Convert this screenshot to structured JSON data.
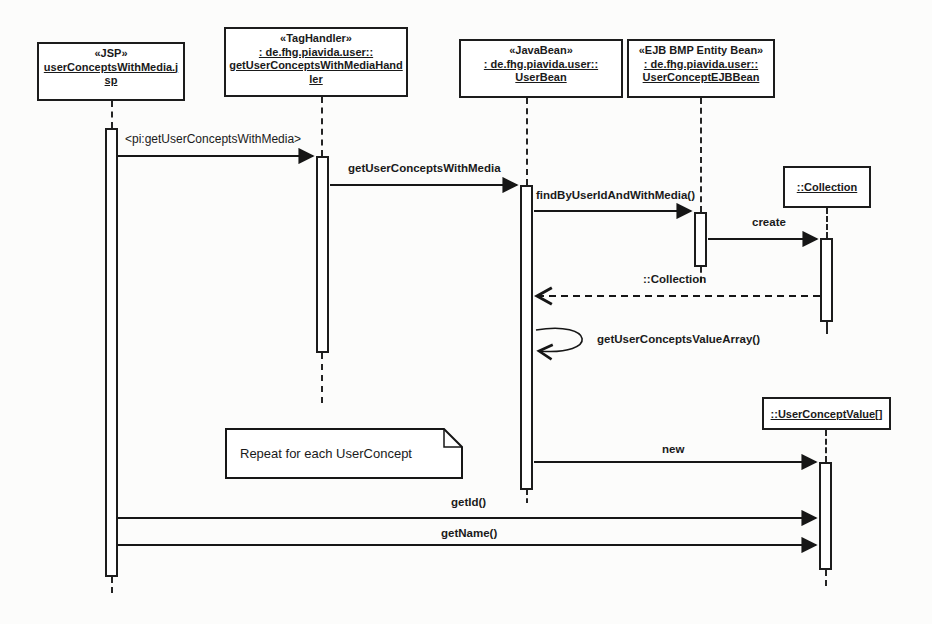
{
  "colors": {
    "ink": "#1c1c1c",
    "paper": "#fcfcfb"
  },
  "participants": [
    {
      "stereotype": "«JSP»",
      "qualifier": "",
      "name": "userConceptsWithMedia.jsp"
    },
    {
      "stereotype": "«TagHandler»",
      "qualifier": ": de.fhg.piavida.user::",
      "name": "getUserConceptsWithMediaHandler"
    },
    {
      "stereotype": "«JavaBean»",
      "qualifier": ": de.fhg.piavida.user::",
      "name": "UserBean"
    },
    {
      "stereotype": "«EJB BMP Entity Bean»",
      "qualifier": ": de.fhg.piavida.user::",
      "name": "UserConceptEJBBean"
    }
  ],
  "objects": [
    {
      "name": "::Collection"
    },
    {
      "name": "::UserConceptValue[]"
    }
  ],
  "messages": [
    {
      "label": "<pi:getUserConceptsWithMedia>",
      "type": "call"
    },
    {
      "label": "getUserConceptsWithMedia",
      "type": "call"
    },
    {
      "label": "findByUserIdAndWithMedia()",
      "type": "call"
    },
    {
      "label": "create",
      "type": "call"
    },
    {
      "label": "::Collection",
      "type": "return"
    },
    {
      "label": "getUserConceptsValueArray()",
      "type": "self-call"
    },
    {
      "label": "new",
      "type": "call"
    },
    {
      "label": "getId()",
      "type": "call"
    },
    {
      "label": "getName()",
      "type": "call"
    }
  ],
  "note": {
    "text": "Repeat for each UserConcept"
  }
}
